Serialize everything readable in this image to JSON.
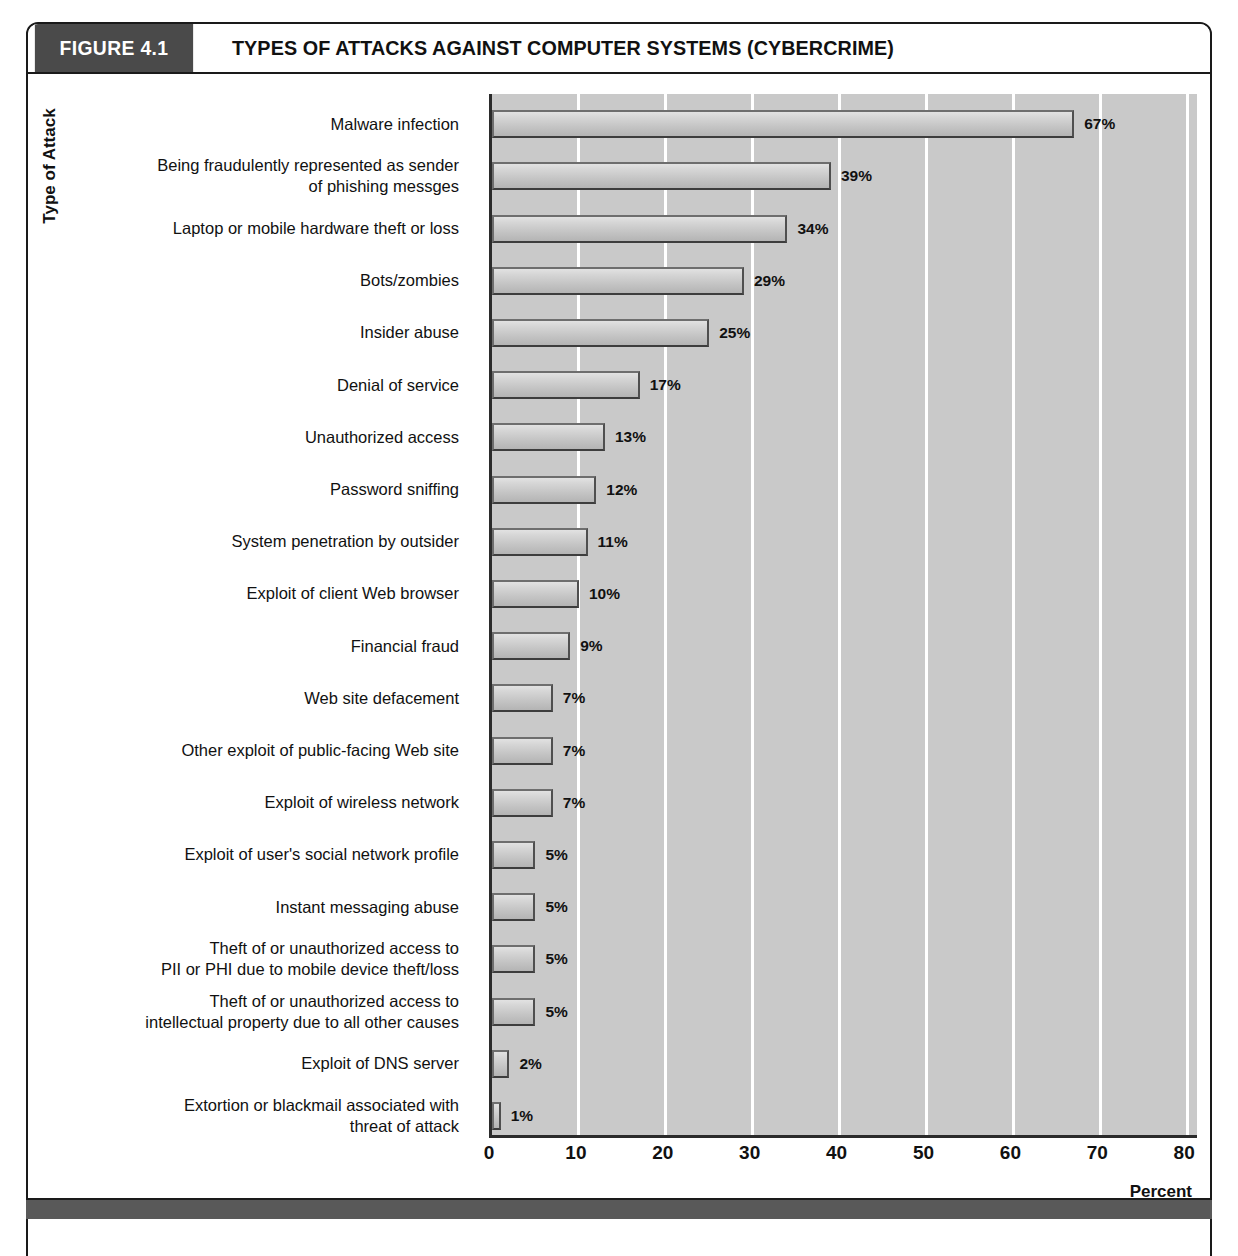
{
  "figure": {
    "number_label": "FIGURE 4.1",
    "title": "TYPES OF ATTACKS AGAINST COMPUTER SYSTEMS (CYBERCRIME)"
  },
  "colors": {
    "header_block": "#4a4a4a",
    "plot_background": "#c9c9c9",
    "gridline": "#ffffff",
    "bar_fill": "#cfcfcf",
    "bar_border": "#6e6e6e",
    "axis": "#2b2b2b",
    "footer_bar": "#595959",
    "text": "#111111"
  },
  "chart_data": {
    "type": "bar",
    "orientation": "horizontal",
    "title": "TYPES OF ATTACKS AGAINST COMPUTER SYSTEMS (CYBERCRIME)",
    "xlabel": "Percent",
    "ylabel": "Type of Attack",
    "xlim": [
      0,
      83
    ],
    "xticks": [
      0,
      10,
      20,
      30,
      40,
      50,
      60,
      70,
      80
    ],
    "xtick_labels": [
      "0",
      "10",
      "20",
      "30",
      "40",
      "50",
      "60",
      "70",
      "80"
    ],
    "grid": "vertical",
    "legend": "none",
    "value_suffix": "%",
    "categories": [
      "Malware infection",
      "Being fraudulently represented as sender\nof phishing messges",
      "Laptop or mobile hardware theft or loss",
      "Bots/zombies",
      "Insider abuse",
      "Denial of service",
      "Unauthorized access",
      "Password sniffing",
      "System penetration by outsider",
      "Exploit of client Web browser",
      "Financial fraud",
      "Web site defacement",
      "Other exploit of public-facing Web site",
      "Exploit of wireless network",
      "Exploit of user's social network profile",
      "Instant messaging abuse",
      "Theft of or unauthorized access to\nPII or PHI due to mobile device theft/loss",
      "Theft of or unauthorized access to\nintellectual property due to all other causes",
      "Exploit of DNS server",
      "Extortion or blackmail associated with\nthreat of attack"
    ],
    "values": [
      67,
      39,
      34,
      29,
      25,
      17,
      13,
      12,
      11,
      10,
      9,
      7,
      7,
      7,
      5,
      5,
      5,
      5,
      2,
      1
    ],
    "value_labels": [
      "67%",
      "39%",
      "34%",
      "29%",
      "25%",
      "17%",
      "13%",
      "12%",
      "11%",
      "10%",
      "9%",
      "7%",
      "7%",
      "7%",
      "5%",
      "5%",
      "5%",
      "5%",
      "2%",
      "1%"
    ]
  }
}
